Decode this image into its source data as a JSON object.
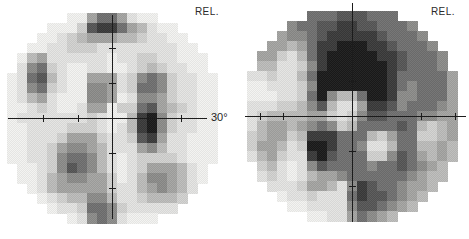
{
  "page": {
    "background": "#ffffff"
  },
  "chart_data": {
    "type": "heatmap",
    "legend_position": "none",
    "grid": "off",
    "palette": [
      "#f2f2f0",
      "#e4e4e2",
      "#d2d2d0",
      "#bcbcba",
      "#a4a4a2",
      "#8c8c8a",
      "#707070",
      "#565656",
      "#3a3a3a",
      "#1a1a1a"
    ],
    "value_scale": "0 = lightest (normal sensitivity), 9 = black (deep relative defect)",
    "plots": [
      {
        "name": "left-greyscale-field",
        "label": "REL.",
        "axis_label": "30°",
        "geometry": {
          "x": 7,
          "y": 13,
          "cell": 10,
          "center_col": 10,
          "center_row": 10,
          "radius_cells": 10.9,
          "axis": {
            "h": {
              "x1": 8,
              "x2": 207,
              "y": 118,
              "ticks": [
                43,
                78,
                147,
                181
              ]
            },
            "v": {
              "x": 112,
              "y1": 15,
              "y2": 219,
              "ticks": [
                48,
                83,
                153,
                188
              ]
            }
          }
        },
        "grid": [
          "000000004664100000000",
          "000000027886431000000",
          "000001234443321100000",
          "000011222111111110000",
          "003411111101122110000",
          "015621001100123211000",
          "016731004441256521100",
          "015621005541266521100",
          "013410005540155421100",
          "001210014402267432100",
          "011111112100389521100",
          "001111222101389521100",
          "001112444211278411000",
          "001124554311145311000",
          "001125665310122221000",
          "000125765310124443100",
          "000134554420135543100",
          "000134444421134543100",
          "000012335531123332100",
          "000001126652111110000",
          "000000015651000000000"
        ]
      },
      {
        "name": "right-greyscale-field",
        "label": "REL.",
        "axis_label": "",
        "geometry": {
          "x": 247,
          "y": 11,
          "cell": 10,
          "center_col": 10,
          "center_row": 10,
          "radius_cells": 10.9,
          "axis": {
            "h": {
              "x1": 245,
              "x2": 466,
              "y": 116,
              "ticks": [
                260,
                283,
                421,
                455
              ]
            },
            "v": {
              "x": 352,
              "y1": 3,
              "y2": 222,
              "ticks": [
                46,
                81,
                151,
                186
              ]
            }
          }
        },
        "grid": [
          "000000666777666000000",
          "000056677887766650000",
          "000455678888876665000",
          "004434688999887666500",
          "044213689999988766650",
          "033112589999998766650",
          "112113699999998666664",
          "001112599999998656664",
          "000112695336998556664",
          "111223573114887566654",
          "123333442125776665544",
          "134434565236666763234",
          "234423888666324662234",
          "244312998665113663343",
          "134211897666225764343",
          "023101576666566765430",
          "012101344566666654330",
          "001112443158766544300",
          "000011211168776543000",
          "000000111157765430000",
          "000000001146543000000"
        ]
      }
    ]
  }
}
